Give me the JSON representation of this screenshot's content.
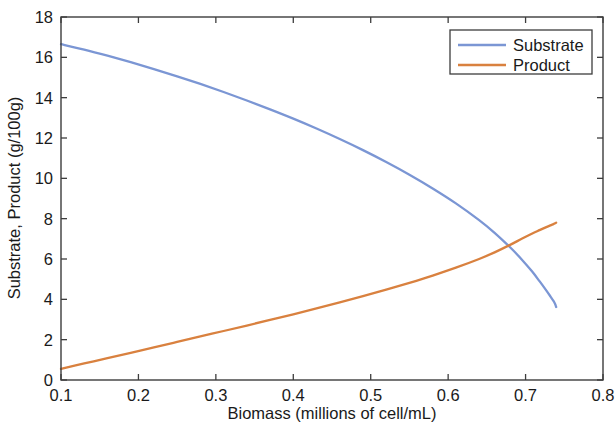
{
  "chart_data": {
    "type": "line",
    "title": "",
    "xlabel": "Biomass (millions of cell/mL)",
    "ylabel": "Substrate, Product (g/100g)",
    "xlim": [
      0.1,
      0.8
    ],
    "ylim": [
      0,
      18
    ],
    "xticks": [
      "0.1",
      "0.2",
      "0.3",
      "0.4",
      "0.5",
      "0.6",
      "0.7",
      "0.8"
    ],
    "xtick_values": [
      0.1,
      0.2,
      0.3,
      0.4,
      0.5,
      0.6,
      0.7,
      0.8
    ],
    "yticks": [
      "0",
      "2",
      "4",
      "6",
      "8",
      "10",
      "12",
      "14",
      "16",
      "18"
    ],
    "ytick_values": [
      0,
      2,
      4,
      6,
      8,
      10,
      12,
      14,
      16,
      18
    ],
    "grid": false,
    "legend_position": "top-right",
    "box": true,
    "tick_direction": "in",
    "series": [
      {
        "name": "Substrate",
        "color": "#7b96d4",
        "x": [
          0.1,
          0.13,
          0.16,
          0.19,
          0.22,
          0.25,
          0.28,
          0.31,
          0.34,
          0.37,
          0.4,
          0.43,
          0.46,
          0.49,
          0.52,
          0.55,
          0.58,
          0.61,
          0.64,
          0.66,
          0.68,
          0.695,
          0.708,
          0.718,
          0.726,
          0.732,
          0.736,
          0.738,
          0.739,
          0.7395
        ],
        "values": [
          16.65,
          16.38,
          16.08,
          15.76,
          15.42,
          15.06,
          14.68,
          14.28,
          13.86,
          13.42,
          12.96,
          12.47,
          11.95,
          11.4,
          10.81,
          10.18,
          9.5,
          8.76,
          7.93,
          7.3,
          6.58,
          5.98,
          5.4,
          4.9,
          4.48,
          4.15,
          3.92,
          3.78,
          3.68,
          3.62
        ]
      },
      {
        "name": "Product",
        "color": "#d9813f",
        "x": [
          0.1,
          0.13,
          0.16,
          0.19,
          0.22,
          0.25,
          0.28,
          0.31,
          0.34,
          0.37,
          0.4,
          0.43,
          0.46,
          0.49,
          0.52,
          0.55,
          0.58,
          0.61,
          0.64,
          0.66,
          0.68,
          0.695,
          0.708,
          0.718,
          0.726,
          0.732,
          0.736,
          0.738,
          0.739,
          0.7395
        ],
        "values": [
          0.55,
          0.82,
          1.08,
          1.35,
          1.62,
          1.89,
          2.16,
          2.43,
          2.7,
          2.98,
          3.26,
          3.55,
          3.85,
          4.16,
          4.48,
          4.82,
          5.18,
          5.57,
          6.0,
          6.33,
          6.7,
          7.0,
          7.25,
          7.43,
          7.57,
          7.67,
          7.73,
          7.77,
          7.79,
          7.8
        ]
      }
    ],
    "legend": [
      {
        "label": "Substrate",
        "color": "#7b96d4"
      },
      {
        "label": "Product",
        "color": "#d9813f"
      }
    ],
    "annotations": {
      "crossing_point": {
        "x": 0.7,
        "y": 6.3
      }
    }
  }
}
